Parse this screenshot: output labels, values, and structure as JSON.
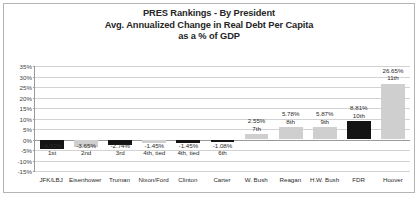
{
  "chart": {
    "title_lines": [
      "PRES Rankings - By President",
      "Avg. Annualized Change in Real Debt Per Capita",
      "as a % of GDP"
    ]
  },
  "chart_data": {
    "type": "bar",
    "xlabel": "",
    "ylabel": "",
    "ylim": [
      -15,
      35
    ],
    "ytick_step": 5,
    "grid": true,
    "legend": "none",
    "ytick_labels": [
      "35%",
      "30%",
      "25%",
      "20%",
      "15%",
      "10%",
      "5%",
      "0%",
      "-5%",
      "-10%",
      "-15%"
    ],
    "ytick_values": [
      35,
      30,
      25,
      20,
      15,
      10,
      5,
      0,
      -5,
      -10,
      -15
    ],
    "categories": [
      "JFK/LBJ",
      "Eisenhower",
      "Truman",
      "Nixon/Ford",
      "Clinton",
      "Carter",
      "W. Bush",
      "Reagan",
      "H.W. Bush",
      "FDR",
      "Hoover"
    ],
    "values": [
      -4.32,
      -3.65,
      -2.74,
      -1.45,
      -1.45,
      -1.08,
      2.55,
      5.78,
      5.87,
      8.81,
      26.65
    ],
    "value_labels": [
      "-4.32%",
      "-3.65%",
      "-2.74%",
      "-1.45%",
      "-1.45%",
      "-1.08%",
      "2.55%",
      "5.78%",
      "5.87%",
      "8.81%",
      "26.65%"
    ],
    "rank_labels": [
      "1st",
      "2nd",
      "3rd",
      "4th, tied",
      "4th, tied",
      "6th",
      "7th",
      "8th",
      "9th",
      "10th",
      "11th"
    ],
    "bar_colors": [
      "#141414",
      "#cfcfcf",
      "#141414",
      "#cfcfcf",
      "#141414",
      "#141414",
      "#cfcfcf",
      "#cfcfcf",
      "#cfcfcf",
      "#141414",
      "#cfcfcf"
    ],
    "colors": {
      "dark": "#141414",
      "light": "#cfcfcf",
      "grid": "#d2d2d2",
      "axis": "#9a9a9a",
      "text": "#2b2b2b"
    }
  }
}
